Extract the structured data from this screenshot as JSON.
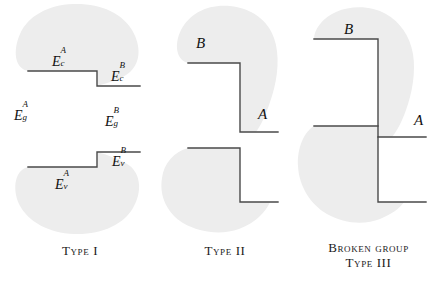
{
  "figure": {
    "background_color": "#ffffff",
    "blob_fill": "#ededed",
    "line_color": "#4a4a4a"
  },
  "panels": [
    {
      "id": "type-1",
      "caption": "Type I",
      "caption_lines": [
        "Type I"
      ],
      "labels": {
        "conduction_a": {
          "base": "E",
          "sup": "A",
          "sub": "c"
        },
        "conduction_b": {
          "base": "E",
          "sup": "B",
          "sub": "c"
        },
        "gap_a": {
          "base": "E",
          "sup": "A",
          "sub": "g"
        },
        "gap_b": {
          "base": "E",
          "sup": "B",
          "sub": "g"
        },
        "valence_a": {
          "base": "E",
          "sup": "A",
          "sub": "v"
        },
        "valence_b": {
          "base": "E",
          "sup": "B",
          "sub": "v"
        }
      },
      "bands": {
        "conduction_a_y": 71,
        "conduction_b_y": 86,
        "valence_b_y": 152,
        "valence_a_y": 167,
        "step_x": 97
      }
    },
    {
      "id": "type-2",
      "caption": "Type II",
      "caption_lines": [
        "Type II"
      ],
      "labels": {
        "material_b": "B",
        "material_a": "A"
      },
      "bands": {
        "conduction_b_y": 63,
        "conduction_a_y": 132,
        "valence_b_y": 148,
        "valence_a_y": 202,
        "step_x": 240
      }
    },
    {
      "id": "type-3",
      "caption": "Broken group Type III",
      "caption_lines": [
        "Broken group",
        "Type III"
      ],
      "labels": {
        "material_b": "B",
        "material_a": "A"
      },
      "bands": {
        "conduction_b_y": 39,
        "valence_b_y": 126,
        "conduction_a_y": 137,
        "valence_a_y": 202,
        "step_x": 378
      }
    }
  ]
}
